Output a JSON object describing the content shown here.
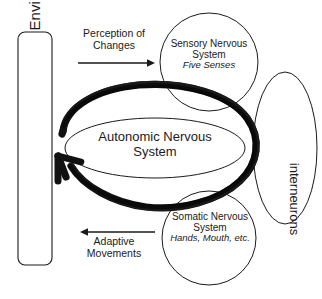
{
  "diagram": {
    "background_color": "#ffffff",
    "stroke_color": "#1a1a1a",
    "thick_loop_color": "#111111",
    "nodes": {
      "environment_box": {
        "label": "Environmental Changes",
        "shape": "rounded-rectangle",
        "orientation": "vertical-text"
      },
      "sensory_circle": {
        "label_line1": "Sensory Nervous",
        "label_line2": "System",
        "sublabel": "Five Senses",
        "shape": "circle"
      },
      "somatic_circle": {
        "label_line1": "Somatic Nervous",
        "label_line2": "System",
        "sublabel": "Hands, Mouth, etc.",
        "shape": "circle"
      },
      "autonomic_ellipse": {
        "label_line1": "Autonomic Nervous",
        "label_line2": "System",
        "shape": "ellipse"
      },
      "interneurons_ellipse": {
        "label": "interneurons",
        "shape": "ellipse",
        "orientation": "vertical-text"
      }
    },
    "arrows": {
      "top_arrow": {
        "label_line1": "Perception of",
        "label_line2": "Changes",
        "direction": "right",
        "description": "from Environmental Changes to Sensory Nervous System"
      },
      "bottom_arrow": {
        "label_line1": "Adaptive",
        "label_line2": "Movements",
        "direction": "left",
        "description": "from Somatic Nervous System to Environmental Changes"
      },
      "thick_loop": {
        "direction": "counterclockwise",
        "description": "heavy hand-drawn oval feedback loop with arrowhead pointing toward Environmental Changes"
      }
    }
  }
}
